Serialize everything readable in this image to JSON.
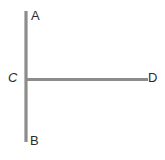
{
  "figure": {
    "kind": "geometry-line-diagram",
    "background_color": "#ffffff",
    "stroke_color": "#8c8c8c",
    "label_color": "#2b2b2b",
    "stroke_width": 3,
    "canvas": {
      "width": 165,
      "height": 160
    },
    "points": [
      {
        "id": "A",
        "label": "A",
        "x": 26,
        "y": 11,
        "label_x": 31,
        "label_y": 9,
        "role": "endpoint-top"
      },
      {
        "id": "B",
        "label": "B",
        "x": 26,
        "y": 142,
        "label_x": 30,
        "label_y": 134,
        "role": "endpoint-bottom"
      },
      {
        "id": "C",
        "label": "C",
        "x": 26,
        "y": 79,
        "label_x": 8,
        "label_y": 71,
        "role": "intersection"
      },
      {
        "id": "D",
        "label": "D",
        "x": 148,
        "y": 79,
        "label_x": 148,
        "label_y": 71,
        "role": "endpoint-right"
      }
    ],
    "segments": [
      {
        "id": "AB",
        "from": "A",
        "to": "B",
        "x1": 26,
        "y1": 11,
        "x2": 26,
        "y2": 142,
        "orientation": "vertical"
      },
      {
        "id": "CD",
        "from": "C",
        "to": "D",
        "x1": 26,
        "y1": 79,
        "x2": 148,
        "y2": 79,
        "orientation": "horizontal"
      }
    ]
  }
}
